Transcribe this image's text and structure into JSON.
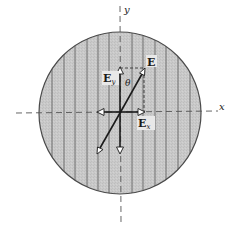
{
  "diagram": {
    "type": "polarizer-field-decomposition",
    "axes": {
      "x_label": "x",
      "y_label": "y",
      "style": "dashed"
    },
    "polarizer": {
      "shape": "circle",
      "center": [
        120,
        113
      ],
      "radius": 81,
      "fill_color": "#c8c8c8",
      "edge_color": "#4a4a4a",
      "stripe_orientation": "vertical",
      "stripe_x_positions": [
        52,
        64,
        75,
        87,
        98,
        109,
        132,
        143,
        155,
        166,
        178,
        190
      ],
      "stripe_color": "#6e6e6e"
    },
    "vectors": [
      {
        "name": "E",
        "label": "E",
        "from": [
          120,
          113
        ],
        "to": [
          144,
          70
        ]
      },
      {
        "name": "E-opposite",
        "label": "",
        "from": [
          120,
          113
        ],
        "to": [
          98,
          152
        ]
      },
      {
        "name": "Ey",
        "label": "E",
        "subscript": "y",
        "from": [
          120,
          113
        ],
        "to": [
          120,
          68
        ]
      },
      {
        "name": "Ey-opposite",
        "label": "",
        "from": [
          120,
          113
        ],
        "to": [
          120,
          153
        ]
      },
      {
        "name": "Ex",
        "label": "E",
        "subscript": "x",
        "from": [
          120,
          112
        ],
        "to": [
          144,
          112
        ]
      },
      {
        "name": "Ex-opposite",
        "label": "",
        "from": [
          120,
          112
        ],
        "to": [
          98,
          112
        ]
      }
    ],
    "angle_label": "θ",
    "projection_lines": "dashed",
    "labels": {
      "E": "E",
      "Ey_main": "E",
      "Ey_sub": "y",
      "Ex_main": "E",
      "Ex_sub": "x",
      "theta": "θ",
      "x_axis": "x",
      "y_axis": "y"
    }
  }
}
